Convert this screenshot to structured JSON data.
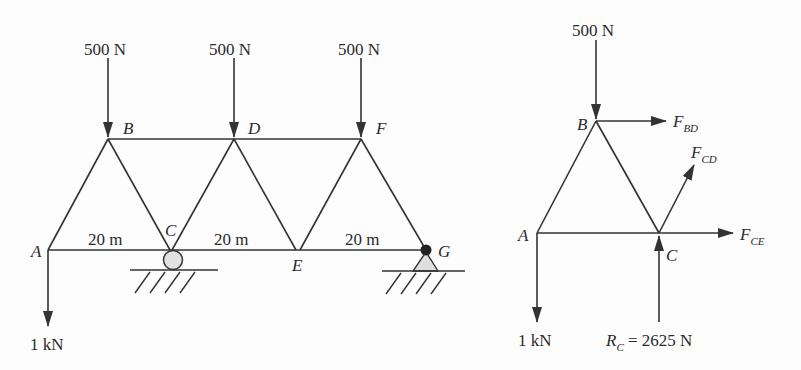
{
  "figure": {
    "left_truss": {
      "title": "Truss with supports",
      "loads": {
        "B": "500 N",
        "D": "500 N",
        "F": "500 N",
        "A": "1 kN"
      },
      "nodes": {
        "A": "A",
        "B": "B",
        "C": "C",
        "D": "D",
        "E": "E",
        "F": "F",
        "G": "G"
      },
      "spans": [
        "20 m",
        "20 m",
        "20 m"
      ],
      "supports": {
        "C": "roller",
        "G": "pin"
      }
    },
    "free_body": {
      "title": "Free-body diagram of section ABC",
      "loads": {
        "B": "500 N",
        "A": "1 kN"
      },
      "nodes": {
        "A": "A",
        "B": "B",
        "C": "C"
      },
      "member_forces": {
        "BD": {
          "symbol": "F",
          "sub": "BD"
        },
        "CD": {
          "symbol": "F",
          "sub": "CD"
        },
        "CE": {
          "symbol": "F",
          "sub": "CE"
        }
      },
      "reaction": {
        "symbol": "R",
        "sub": "C",
        "value": "= 2625 N"
      }
    }
  }
}
